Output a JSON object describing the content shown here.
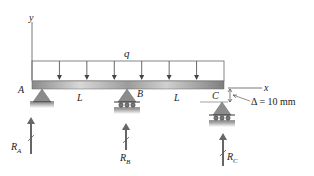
{
  "diagram": {
    "type": "continuous beam with uniform load and settled support",
    "axes": {
      "x_label": "x",
      "y_label": "y"
    },
    "load": {
      "label": "q",
      "arrow_count": 6,
      "kind": "uniformly distributed"
    },
    "supports": [
      {
        "id": "A",
        "label": "A",
        "kind": "pin"
      },
      {
        "id": "B",
        "label": "B",
        "kind": "roller"
      },
      {
        "id": "C",
        "label": "C",
        "kind": "roller",
        "settlement": true
      }
    ],
    "spans": [
      {
        "label": "L",
        "from": "A",
        "to": "B"
      },
      {
        "label": "L",
        "from": "B",
        "to": "C"
      }
    ],
    "settlement": {
      "symbol": "Δ",
      "text": "Δ = 10 mm",
      "value": 10,
      "unit": "mm"
    },
    "reactions": [
      {
        "label": "R",
        "subscript": "A"
      },
      {
        "label": "R",
        "subscript": "B"
      },
      {
        "label": "R",
        "subscript": "C"
      }
    ],
    "colors": {
      "beam": "#9a9a9a",
      "support": "#8c8c8c",
      "line": "#555555",
      "text": "#222222"
    }
  }
}
